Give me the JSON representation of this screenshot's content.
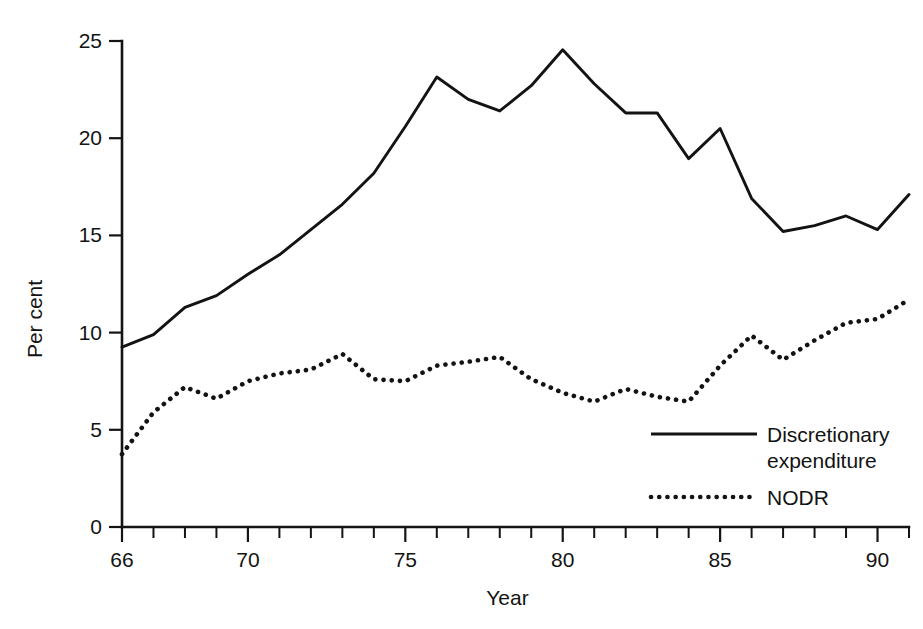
{
  "chart_data": {
    "type": "line",
    "title": "",
    "subtitle": "",
    "xlabel": "Year",
    "ylabel": "Per cent",
    "xlim": [
      66,
      91
    ],
    "ylim": [
      0,
      25
    ],
    "grid": false,
    "legend_position": "inside-bottom-right",
    "y_ticks": [
      0,
      5,
      10,
      15,
      20,
      25
    ],
    "y_tick_labels": [
      "0",
      "5",
      "10",
      "15",
      "20",
      "25"
    ],
    "x_ticks": [
      66,
      67,
      68,
      69,
      70,
      71,
      72,
      73,
      74,
      75,
      76,
      77,
      78,
      79,
      80,
      81,
      82,
      83,
      84,
      85,
      86,
      87,
      88,
      89,
      90,
      91
    ],
    "x_tick_labels": [
      "66",
      "",
      "",
      "",
      "70",
      "",
      "",
      "",
      "",
      "75",
      "",
      "",
      "",
      "",
      "80",
      "",
      "",
      "",
      "",
      "85",
      "",
      "",
      "",
      "",
      "90",
      ""
    ],
    "x": [
      66,
      67,
      68,
      69,
      70,
      71,
      72,
      73,
      74,
      75,
      76,
      77,
      78,
      79,
      80,
      81,
      82,
      83,
      84,
      85,
      86,
      87,
      88,
      89,
      90,
      91
    ],
    "series": [
      {
        "name": "Discretionary expenditure",
        "style": "solid",
        "color": "#131313",
        "values": [
          9.25,
          9.9,
          11.3,
          11.9,
          13.0,
          14.0,
          15.3,
          16.6,
          18.2,
          20.6,
          23.15,
          22.0,
          21.4,
          22.7,
          24.55,
          22.8,
          21.3,
          21.3,
          18.95,
          20.5,
          16.9,
          15.2,
          15.5,
          16.0,
          15.3,
          17.1
        ]
      },
      {
        "name": "NODR",
        "style": "dotted",
        "color": "#131313",
        "values": [
          3.75,
          5.9,
          7.2,
          6.6,
          7.5,
          7.9,
          8.1,
          8.9,
          7.6,
          7.5,
          8.3,
          8.5,
          8.75,
          7.6,
          6.9,
          6.45,
          7.1,
          6.7,
          6.45,
          8.3,
          9.85,
          8.6,
          9.6,
          10.5,
          10.7,
          11.7
        ]
      }
    ],
    "legend": [
      {
        "label_line1": "Discretionary",
        "label_line2": "expenditure",
        "style": "solid"
      },
      {
        "label_line1": "NODR",
        "label_line2": "",
        "style": "dotted"
      }
    ]
  }
}
